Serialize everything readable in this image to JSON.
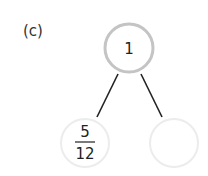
{
  "problem": {
    "label": "(c)",
    "bond": {
      "whole": "1",
      "parts": [
        {
          "numerator": "5",
          "denominator": "12"
        },
        {
          "value": ""
        }
      ]
    }
  },
  "colors": {
    "whole_border": "#c4c4c4",
    "part_border": "#ececec",
    "line": "#222222"
  }
}
